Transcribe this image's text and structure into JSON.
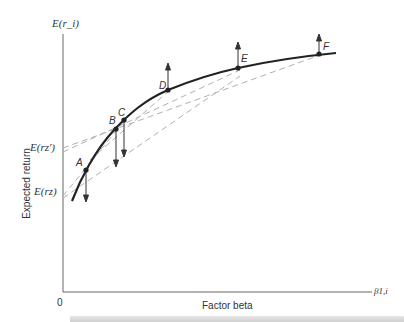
{
  "diagram": {
    "y_axis_title": "E(r_i)",
    "y_axis_label": "Expected return",
    "x_axis_label": "Factor beta",
    "x_axis_symbol": "β1,i",
    "origin_label": "0",
    "y_ticks": {
      "rz_prime": "E(rz')",
      "rz": "E(rz)"
    },
    "points": [
      {
        "id": "A",
        "label": "A",
        "arrow": "down"
      },
      {
        "id": "B",
        "label": "B",
        "arrow": "down"
      },
      {
        "id": "C",
        "label": "C",
        "arrow": "down"
      },
      {
        "id": "D",
        "label": "D",
        "arrow": "up"
      },
      {
        "id": "E",
        "label": "E",
        "arrow": "up"
      },
      {
        "id": "F",
        "label": "F",
        "arrow": "up"
      }
    ],
    "colors": {
      "curve": "#222222",
      "axis": "#555555",
      "dashed": "#aaaaaa",
      "text": "#333333"
    }
  }
}
